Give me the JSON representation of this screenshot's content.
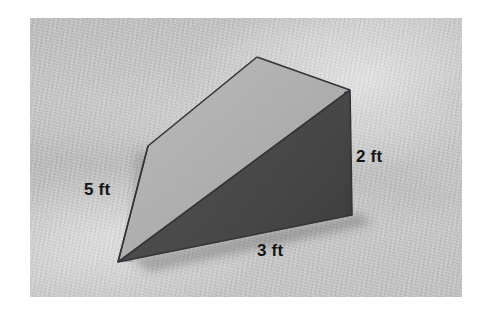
{
  "figure": {
    "type": "triangular-prism-wedge",
    "background_color": "#bdbdbd",
    "page_color": "#ffffff",
    "faces": {
      "top_slanted": {
        "name": "top-slanted-face",
        "color": "#b2b2b2"
      },
      "front_right": {
        "name": "front-right-face",
        "color": "#4d4d4d"
      },
      "right_end": {
        "name": "right-end-face",
        "color": "#474747"
      },
      "left_side": {
        "name": "left-side-face",
        "color": "#ababab"
      },
      "edge_color": "#3a3a3a"
    },
    "labels": [
      {
        "id": "label-5ft",
        "text": "5 ft",
        "edge": "slant-length"
      },
      {
        "id": "label-2ft",
        "text": "2 ft",
        "edge": "height"
      },
      {
        "id": "label-3ft",
        "text": "3 ft",
        "edge": "base-length"
      }
    ],
    "geometry": {
      "apex_top": [
        257,
        57
      ],
      "ridge_right": [
        350,
        90
      ],
      "bottom_right": [
        352,
        215
      ],
      "bottom_point": [
        118,
        262
      ],
      "left_vertex": [
        148,
        146
      ]
    }
  }
}
